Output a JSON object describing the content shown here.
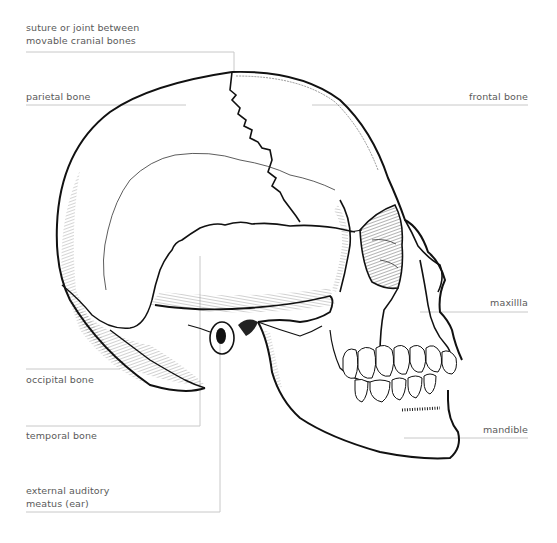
{
  "diagram": {
    "labels": {
      "suture": [
        "suture or joint between",
        "movable cranial bones"
      ],
      "parietal": "parietal bone",
      "frontal": "frontal bone",
      "maxilla": "maxillla",
      "occipital": "occipital bone",
      "temporal": "temporal bone",
      "ear": [
        "external auditory",
        "meatus (ear)"
      ],
      "mandible": "mandible"
    },
    "colors": {
      "line": "#111111",
      "leader": "#c8c8c8",
      "text": "#5a5a5a",
      "background": "#ffffff"
    }
  }
}
